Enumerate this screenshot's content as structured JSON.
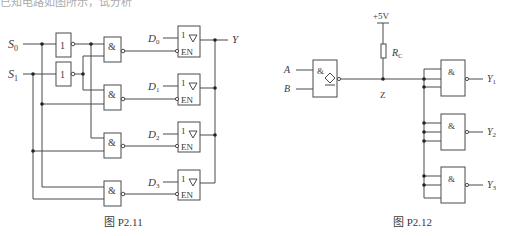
{
  "header_fragment": "已知电路如图所示，试分析",
  "figures": [
    {
      "id": "P2.11",
      "caption": "图 P2.11",
      "inputs": {
        "s0": "S",
        "s0_sub": "0",
        "s1": "S",
        "s1_sub": "1"
      },
      "not_gate_symbol": "1",
      "and_gate_symbol": "&",
      "buffers": [
        {
          "data": "D",
          "sub": "0",
          "symbol": "1",
          "enable": "EN"
        },
        {
          "data": "D",
          "sub": "1",
          "symbol": "1",
          "enable": "EN"
        },
        {
          "data": "D",
          "sub": "2",
          "symbol": "1",
          "enable": "EN"
        },
        {
          "data": "D",
          "sub": "3",
          "symbol": "1",
          "enable": "EN"
        }
      ],
      "output": "Y"
    },
    {
      "id": "P2.12",
      "caption": "图 P2.12",
      "supply": "+5V",
      "resistor": {
        "label": "R",
        "sub": "C"
      },
      "inputs": {
        "a": "A",
        "b": "B"
      },
      "oc_gate_symbol": "&",
      "node": "Z",
      "nand_gates": [
        {
          "symbol": "&",
          "output": "Y",
          "sub": "1"
        },
        {
          "symbol": "&",
          "output": "Y",
          "sub": "2"
        },
        {
          "symbol": "&",
          "output": "Y",
          "sub": "3"
        }
      ]
    }
  ]
}
